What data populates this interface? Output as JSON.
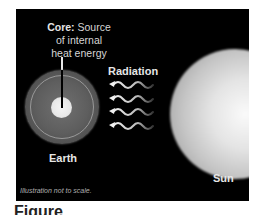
{
  "diagram": {
    "core_label": {
      "bold": "Core:",
      "text_line1": " Source",
      "line2": "of internal",
      "line3": "heat energy"
    },
    "earth_label": "Earth",
    "radiation_label": "Radiation",
    "sun_label": "Sun",
    "note": "Illustration not to scale.",
    "caption": "Figure",
    "colors": {
      "background": "#000000",
      "text": "#e6e6e6",
      "page": "#ffffff"
    }
  }
}
